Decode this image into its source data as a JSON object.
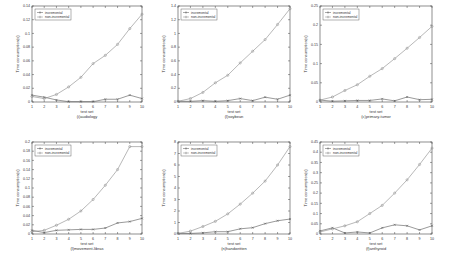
{
  "chart_data": [
    {
      "type": "line",
      "caption": "(i)audiology",
      "xlabel": "test set",
      "ylabel": "Time consumption(s)",
      "x": [
        1,
        2,
        3,
        4,
        5,
        6,
        7,
        8,
        9,
        10
      ],
      "xticks": [
        "1",
        "2",
        "3",
        "4",
        "5",
        "6",
        "7",
        "8",
        "9",
        "10"
      ],
      "ylim": [
        0,
        0.14
      ],
      "yticks": [
        "0",
        "0.02",
        "0.04",
        "0.06",
        "0.08",
        "0.1",
        "0.12",
        "0.14"
      ],
      "legend": "top-left",
      "series": [
        {
          "name": "incremental",
          "marker": "x",
          "values": [
            0.01,
            0.007,
            0.003,
            0.0005,
            0.0005,
            0.0005,
            0.004,
            0.004,
            0.01,
            0.005
          ]
        },
        {
          "name": "non-incremental",
          "marker": "o",
          "values": [
            0.008,
            0.005,
            0.011,
            0.022,
            0.036,
            0.056,
            0.068,
            0.084,
            0.107,
            0.128
          ]
        }
      ]
    },
    {
      "type": "line",
      "caption": "(l)soybean",
      "xlabel": "test set",
      "ylabel": "Time consumption(s)",
      "x": [
        1,
        2,
        3,
        4,
        5,
        6,
        7,
        8,
        9,
        10
      ],
      "xticks": [
        "1",
        "2",
        "3",
        "4",
        "5",
        "6",
        "7",
        "8",
        "9",
        "10"
      ],
      "ylim": [
        0,
        1.4
      ],
      "yticks": [
        "0",
        "0.2",
        "0.4",
        "0.6",
        "0.8",
        "1",
        "1.2",
        "1.4"
      ],
      "legend": "top-left",
      "series": [
        {
          "name": "incremental",
          "marker": "x",
          "values": [
            0.01,
            0.01,
            0.02,
            0.01,
            0.02,
            0.05,
            0.02,
            0.07,
            0.04,
            0.1
          ]
        },
        {
          "name": "non-incremental",
          "marker": "o",
          "values": [
            0.01,
            0.05,
            0.14,
            0.28,
            0.39,
            0.57,
            0.74,
            0.91,
            1.13,
            1.36
          ]
        }
      ]
    },
    {
      "type": "line",
      "caption": "(c)primary-tumor",
      "xlabel": "test set",
      "ylabel": "Time consumption(s)",
      "x": [
        1,
        2,
        3,
        4,
        5,
        6,
        7,
        8,
        9,
        10
      ],
      "xticks": [
        "1",
        "2",
        "3",
        "4",
        "5",
        "6",
        "7",
        "8",
        "9",
        "10"
      ],
      "ylim": [
        0,
        0.25
      ],
      "yticks": [
        "0",
        "0.05",
        "0.1",
        "0.15",
        "0.2",
        "0.25"
      ],
      "legend": "top-left",
      "series": [
        {
          "name": "incremental",
          "marker": "x",
          "values": [
            0.005,
            0.002,
            0.003,
            0.004,
            0.004,
            0.008,
            0.003,
            0.013,
            0.006,
            0.007
          ]
        },
        {
          "name": "non-incremental",
          "marker": "o",
          "values": [
            0.005,
            0.013,
            0.03,
            0.045,
            0.067,
            0.087,
            0.113,
            0.14,
            0.168,
            0.197
          ]
        }
      ]
    },
    {
      "type": "line",
      "caption": "(l)movement-libras",
      "xlabel": "test set",
      "ylabel": "Time consumption(s)",
      "x": [
        1,
        2,
        3,
        4,
        5,
        6,
        7,
        8,
        9,
        10
      ],
      "xticks": [
        "1",
        "2",
        "3",
        "4",
        "5",
        "6",
        "7",
        "8",
        "9",
        "10"
      ],
      "ylim": [
        0,
        0.2
      ],
      "yticks": [
        "0",
        "0.02",
        "0.04",
        "0.06",
        "0.08",
        "0.1",
        "0.12",
        "0.14",
        "0.16",
        "0.18",
        "0.2"
      ],
      "legend": "top-left",
      "series": [
        {
          "name": "incremental",
          "marker": "x",
          "values": [
            0.008,
            0.003,
            0.008,
            0.009,
            0.01,
            0.01,
            0.013,
            0.024,
            0.027,
            0.034
          ]
        },
        {
          "name": "non-incremental",
          "marker": "o",
          "values": [
            0.005,
            0.008,
            0.019,
            0.032,
            0.05,
            0.075,
            0.106,
            0.14,
            0.19,
            0.19
          ]
        }
      ]
    },
    {
      "type": "line",
      "caption": "(n)handwritten",
      "xlabel": "test set",
      "ylabel": "Time consumption(s)",
      "x": [
        1,
        2,
        3,
        4,
        5,
        6,
        7,
        8,
        9,
        10
      ],
      "xticks": [
        "1",
        "2",
        "3",
        "4",
        "5",
        "6",
        "7",
        "8",
        "9",
        "10"
      ],
      "ylim": [
        0,
        8
      ],
      "yticks": [
        "0",
        "1",
        "2",
        "3",
        "4",
        "5",
        "6",
        "7",
        "8"
      ],
      "legend": "top-left",
      "series": [
        {
          "name": "incremental",
          "marker": "x",
          "values": [
            0.05,
            0.05,
            0.1,
            0.2,
            0.2,
            0.45,
            0.55,
            0.9,
            1.15,
            1.3
          ]
        },
        {
          "name": "non-incremental",
          "marker": "o",
          "values": [
            0.05,
            0.25,
            0.65,
            1.1,
            1.75,
            2.6,
            3.55,
            4.6,
            6.0,
            7.6
          ]
        }
      ]
    },
    {
      "type": "line",
      "caption": "(f)anthyroid",
      "xlabel": "test set",
      "ylabel": "Time consumption(s)",
      "x": [
        1,
        2,
        3,
        4,
        5,
        6,
        7,
        8,
        9,
        10
      ],
      "xticks": [
        "1",
        "2",
        "3",
        "4",
        "5",
        "6",
        "7",
        "8",
        "9",
        "10"
      ],
      "ylim": [
        0,
        0.45
      ],
      "yticks": [
        "0",
        "0.05",
        "0.1",
        "0.15",
        "0.2",
        "0.25",
        "0.3",
        "0.35",
        "0.4",
        "0.45"
      ],
      "legend": "top-left",
      "series": [
        {
          "name": "incremental",
          "marker": "x",
          "values": [
            0.015,
            0.03,
            0.005,
            0.01,
            0.005,
            0.03,
            0.045,
            0.04,
            0.02,
            0.04
          ]
        },
        {
          "name": "non-incremental",
          "marker": "o",
          "values": [
            0.01,
            0.025,
            0.04,
            0.06,
            0.1,
            0.14,
            0.2,
            0.265,
            0.34,
            0.42
          ]
        }
      ]
    }
  ]
}
